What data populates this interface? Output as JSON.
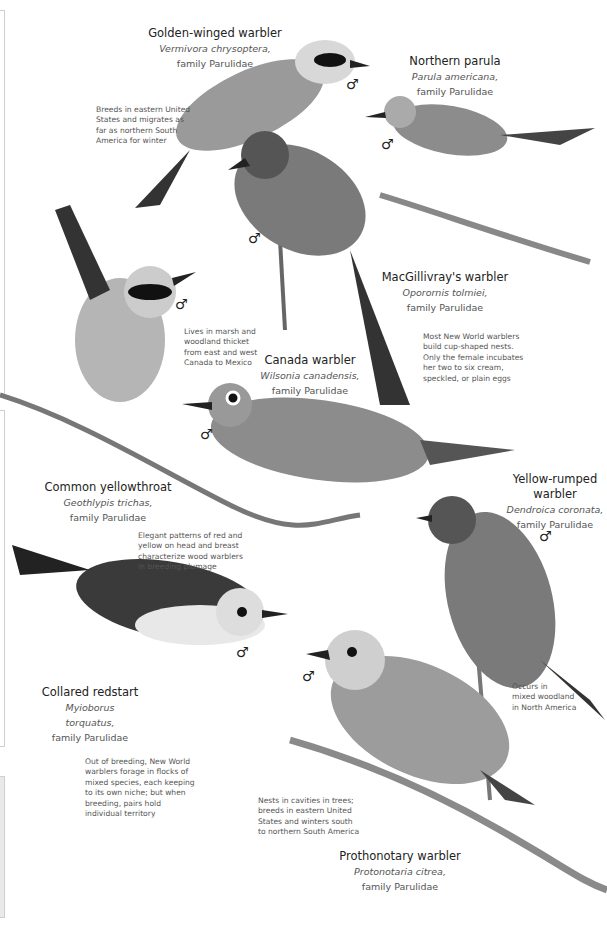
{
  "species": [
    {
      "common": "Golden-winged warbler",
      "scientific": "Vermivora chrysoptera,",
      "family": "family Parulidae"
    },
    {
      "common": "Northern parula",
      "scientific": "Parula americana,",
      "family": "family Parulidae"
    },
    {
      "common": "MacGillivray's warbler",
      "scientific": "Oporornis tolmiei,",
      "family": "family Parulidae"
    },
    {
      "common": "Canada warbler",
      "scientific": "Wilsonia canadensis,",
      "family": "family Parulidae"
    },
    {
      "common": "Common yellowthroat",
      "scientific": "Geothlypis trichas,",
      "family": "family Parulidae"
    },
    {
      "common": "Yellow-rumped warbler",
      "common_line1": "Yellow-rumped",
      "common_line2": "warbler",
      "scientific": "Dendroica coronata,",
      "family": "family Parulidae"
    },
    {
      "common": "Collared redstart",
      "scientific": "Myioborus torquatus,",
      "family": "family Parulidae"
    },
    {
      "common": "Prothonotary warbler",
      "scientific": "Protonotaria citrea,",
      "family": "family Parulidae"
    }
  ],
  "notes": {
    "golden_winged": [
      "Breeds in eastern United",
      "States and migrates as",
      "far as northern South",
      "America for winter"
    ],
    "yellowthroat": [
      "Lives in marsh and",
      "woodland thicket",
      "from east and west",
      "Canada to Mexico"
    ],
    "nests": [
      "Most New World warblers",
      "build cup-shaped nests.",
      "Only the female incubates",
      "her two to six cream,",
      "speckled, or plain eggs"
    ],
    "plumage": [
      "Elegant patterns of red and",
      "yellow on head and breast",
      "characterize wood warblers",
      "in breeding plumage"
    ],
    "yellow_rumped": [
      "Occurs in",
      "mixed woodland",
      "in North America"
    ],
    "flocks": [
      "Out of breeding, New World",
      "warblers forage in flocks of",
      "mixed species, each keeping",
      "to its own niche; but when",
      "breeding, pairs hold",
      "individual territory"
    ],
    "prothonotary": [
      "Nests in cavities in trees;",
      "breeds in eastern United",
      "States and winters south",
      "to northern South America"
    ]
  },
  "male_symbol": "♂",
  "colors": {
    "text": "#333333",
    "italic": "#555555",
    "frame": "#cfcfcf"
  }
}
